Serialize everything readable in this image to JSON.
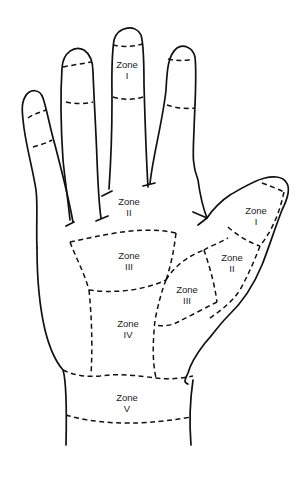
{
  "diagram": {
    "colors": {
      "line": "#111111",
      "text": "#222222",
      "background": "#ffffff"
    },
    "labels": [
      {
        "id": "zone-1-middle-finger",
        "title": "Zone",
        "numeral": "I",
        "x": 127,
        "y": 59
      },
      {
        "id": "zone-2-palm",
        "title": "Zone",
        "numeral": "II",
        "x": 129,
        "y": 196
      },
      {
        "id": "zone-3-palm",
        "title": "Zone",
        "numeral": "III",
        "x": 129,
        "y": 250
      },
      {
        "id": "zone-4-palm",
        "title": "Zone",
        "numeral": "IV",
        "x": 128,
        "y": 318
      },
      {
        "id": "zone-5-wrist",
        "title": "Zone",
        "numeral": "V",
        "x": 127,
        "y": 392
      },
      {
        "id": "zone-1-thumb",
        "title": "Zone",
        "numeral": "I",
        "x": 256,
        "y": 205
      },
      {
        "id": "zone-2-thumb",
        "title": "Zone",
        "numeral": "II",
        "x": 232,
        "y": 252
      },
      {
        "id": "zone-3-thumb",
        "title": "Zone",
        "numeral": "III",
        "x": 187,
        "y": 284
      }
    ]
  }
}
